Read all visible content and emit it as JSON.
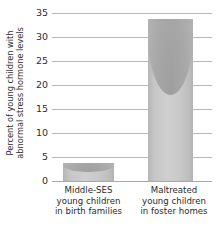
{
  "chart_data": {
    "type": "bar",
    "title": "",
    "xlabel": "",
    "ylabel_line1": "Percent of young children with",
    "ylabel_line2": "abnormal stress hormone levels",
    "ylabel": "Percent of young children with abnormal stress hormone levels",
    "categories": [
      "Middle-SES young children in birth families",
      "Maltreated young children in foster homes"
    ],
    "category_lines": [
      [
        "Middle-SES",
        "young children",
        "in birth families"
      ],
      [
        "Maltreated",
        "young children",
        "in foster homes"
      ]
    ],
    "values": [
      3.7,
      33.5
    ],
    "ylim": [
      0,
      35
    ],
    "yticks": [
      35,
      30,
      25,
      20,
      15,
      10,
      5,
      0
    ],
    "ytick_labels": [
      "35",
      "30",
      "25",
      "20",
      "15",
      "10",
      "5",
      "0"
    ],
    "grid": true,
    "legend": "none",
    "bar_color": "#c8c8c8",
    "bar_edge_color": "#b0b0b0",
    "grid_color": "#b9b9b9",
    "text_color": "#2b2b2b"
  }
}
